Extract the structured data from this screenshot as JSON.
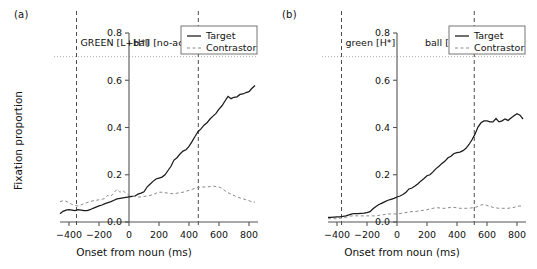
{
  "figure": {
    "panels": [
      {
        "tag": "(a)",
        "annotations": [
          {
            "text": "GREEN [L+H*]",
            "x_ms": -350
          },
          {
            "text": "ball [no-acc]",
            "x_ms": 462
          }
        ],
        "legend": {
          "position": "top-right",
          "entries": [
            {
              "label": "Target",
              "style": "solid"
            },
            {
              "label": "Contrastor",
              "style": "dashed"
            }
          ]
        },
        "chart_data": {
          "type": "line",
          "title": "(a)",
          "xlabel": "Onset from noun (ms)",
          "ylabel": "Fixation proportion",
          "xlim": [
            -460,
            860
          ],
          "ylim": [
            0.0,
            0.8
          ],
          "xticks": [
            -400,
            -200,
            0,
            200,
            400,
            600,
            800
          ],
          "yticks": [
            0.0,
            0.2,
            0.4,
            0.6,
            0.8
          ],
          "grid": false,
          "vlines": [
            -350,
            462
          ],
          "hline": 0.7,
          "x": [
            -460,
            -440,
            -420,
            -400,
            -380,
            -360,
            -340,
            -320,
            -300,
            -280,
            -260,
            -240,
            -220,
            -200,
            -180,
            -160,
            -140,
            -120,
            -100,
            -80,
            -60,
            -40,
            -20,
            0,
            20,
            40,
            60,
            80,
            100,
            120,
            140,
            160,
            180,
            200,
            220,
            240,
            260,
            280,
            300,
            320,
            340,
            360,
            380,
            400,
            420,
            440,
            460,
            480,
            500,
            520,
            540,
            560,
            580,
            600,
            620,
            640,
            660,
            680,
            700,
            720,
            740,
            760,
            780,
            800,
            820,
            840
          ],
          "series": [
            {
              "name": "Target",
              "style": "solid",
              "values": [
                0.035,
                0.045,
                0.05,
                0.052,
                0.05,
                0.048,
                0.052,
                0.05,
                0.048,
                0.048,
                0.052,
                0.058,
                0.063,
                0.068,
                0.072,
                0.078,
                0.082,
                0.086,
                0.092,
                0.098,
                0.1,
                0.102,
                0.104,
                0.106,
                0.108,
                0.11,
                0.118,
                0.122,
                0.128,
                0.148,
                0.16,
                0.172,
                0.182,
                0.186,
                0.19,
                0.2,
                0.218,
                0.236,
                0.262,
                0.272,
                0.288,
                0.3,
                0.306,
                0.32,
                0.34,
                0.362,
                0.382,
                0.394,
                0.41,
                0.42,
                0.436,
                0.448,
                0.46,
                0.478,
                0.492,
                0.512,
                0.532,
                0.522,
                0.528,
                0.53,
                0.54,
                0.542,
                0.548,
                0.552,
                0.566,
                0.578
              ]
            },
            {
              "name": "Contrastor",
              "style": "dashed",
              "values": [
                0.086,
                0.09,
                0.088,
                0.082,
                0.074,
                0.07,
                0.068,
                0.072,
                0.078,
                0.082,
                0.086,
                0.09,
                0.092,
                0.094,
                0.096,
                0.1,
                0.114,
                0.11,
                0.124,
                0.138,
                0.126,
                0.132,
                0.122,
                0.114,
                0.11,
                0.108,
                0.106,
                0.106,
                0.108,
                0.11,
                0.112,
                0.116,
                0.122,
                0.126,
                0.126,
                0.124,
                0.122,
                0.12,
                0.12,
                0.122,
                0.124,
                0.126,
                0.13,
                0.134,
                0.138,
                0.142,
                0.146,
                0.148,
                0.148,
                0.148,
                0.15,
                0.152,
                0.15,
                0.148,
                0.142,
                0.132,
                0.124,
                0.118,
                0.112,
                0.106,
                0.102,
                0.098,
                0.094,
                0.09,
                0.086,
                0.084
              ]
            }
          ]
        }
      },
      {
        "tag": "(b)",
        "annotations": [
          {
            "text": "green [H*]",
            "x_ms": -370
          },
          {
            "text": "ball [!H*]",
            "x_ms": 515
          }
        ],
        "legend": {
          "position": "top-right",
          "entries": [
            {
              "label": "Target",
              "style": "solid"
            },
            {
              "label": "Contrastor",
              "style": "dashed"
            }
          ]
        },
        "chart_data": {
          "type": "line",
          "title": "(b)",
          "xlabel": "Onset from noun (ms)",
          "ylabel": "Fixation proportion",
          "xlim": [
            -460,
            860
          ],
          "ylim": [
            0.0,
            0.8
          ],
          "xticks": [
            -400,
            -200,
            0,
            200,
            400,
            600,
            800
          ],
          "yticks": [
            0.0,
            0.2,
            0.4,
            0.6,
            0.8
          ],
          "grid": false,
          "vlines": [
            -370,
            515
          ],
          "hline": 0.7,
          "x": [
            -460,
            -440,
            -420,
            -400,
            -380,
            -360,
            -340,
            -320,
            -300,
            -280,
            -260,
            -240,
            -220,
            -200,
            -180,
            -160,
            -140,
            -120,
            -100,
            -80,
            -60,
            -40,
            -20,
            0,
            20,
            40,
            60,
            80,
            100,
            120,
            140,
            160,
            180,
            200,
            220,
            240,
            260,
            280,
            300,
            320,
            340,
            360,
            380,
            400,
            420,
            440,
            460,
            480,
            500,
            520,
            540,
            560,
            580,
            600,
            620,
            640,
            660,
            680,
            700,
            720,
            740,
            760,
            780,
            800,
            820,
            840
          ],
          "series": [
            {
              "name": "Target",
              "style": "solid",
              "values": [
                0.02,
                0.02,
                0.021,
                0.022,
                0.022,
                0.024,
                0.026,
                0.03,
                0.034,
                0.036,
                0.036,
                0.037,
                0.038,
                0.04,
                0.044,
                0.056,
                0.066,
                0.074,
                0.08,
                0.086,
                0.092,
                0.096,
                0.1,
                0.106,
                0.11,
                0.116,
                0.126,
                0.14,
                0.144,
                0.152,
                0.162,
                0.174,
                0.184,
                0.196,
                0.2,
                0.212,
                0.226,
                0.236,
                0.248,
                0.258,
                0.272,
                0.278,
                0.29,
                0.294,
                0.296,
                0.302,
                0.312,
                0.328,
                0.348,
                0.372,
                0.402,
                0.42,
                0.428,
                0.428,
                0.424,
                0.424,
                0.438,
                0.424,
                0.428,
                0.436,
                0.43,
                0.44,
                0.45,
                0.458,
                0.452,
                0.436
              ]
            },
            {
              "name": "Contrastor",
              "style": "dashed",
              "values": [
                0.014,
                0.014,
                0.014,
                0.014,
                0.016,
                0.018,
                0.02,
                0.024,
                0.026,
                0.026,
                0.026,
                0.026,
                0.026,
                0.026,
                0.026,
                0.026,
                0.026,
                0.028,
                0.03,
                0.032,
                0.034,
                0.034,
                0.034,
                0.034,
                0.036,
                0.038,
                0.04,
                0.042,
                0.044,
                0.044,
                0.046,
                0.048,
                0.05,
                0.052,
                0.056,
                0.058,
                0.06,
                0.06,
                0.058,
                0.058,
                0.06,
                0.062,
                0.062,
                0.06,
                0.058,
                0.058,
                0.058,
                0.058,
                0.06,
                0.062,
                0.066,
                0.072,
                0.074,
                0.07,
                0.066,
                0.062,
                0.06,
                0.058,
                0.058,
                0.058,
                0.058,
                0.06,
                0.062,
                0.066,
                0.068,
                0.066
              ]
            }
          ]
        }
      }
    ],
    "colors": {
      "target_line": "#1a1a1a",
      "contrastor_line": "#8c8c8c",
      "axis": "#555555",
      "guide_line": "#4d4d4d",
      "hline": "#9a9a9a",
      "legend_border": "#666666",
      "text": "#111111"
    }
  }
}
